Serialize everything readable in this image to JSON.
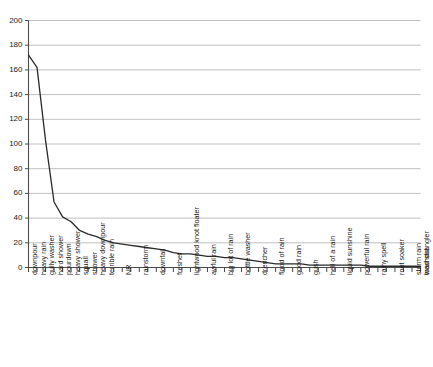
{
  "chart_data": {
    "type": "line",
    "title": "",
    "subtitle": "",
    "xlabel": "",
    "ylabel": "",
    "xlim": [
      0,
      47
    ],
    "ylim": [
      0,
      200
    ],
    "grid": true,
    "grid_axis": "y",
    "legend": "none",
    "line_color": "#2b2b2b",
    "grid_color": "#b0b0b0",
    "axis_color": "#4d4d4d",
    "yticks": [
      0,
      20,
      40,
      60,
      80,
      100,
      120,
      140,
      160,
      180,
      200
    ],
    "ytick_labels": [
      "0",
      "20",
      "40",
      "60",
      "80",
      "100",
      "120",
      "140",
      "160",
      "180",
      "200"
    ],
    "categories": [
      "downpour",
      "heavy rain",
      "gully washer",
      "hard shower",
      "pourdown",
      "heavy shower",
      "squall",
      "shower",
      "heavy downpour",
      "terrible rain",
      "NR",
      "rainstorm",
      "downfall",
      "freshet",
      "lightwood knot floater",
      "awful rain",
      "big lot of rain",
      "bottle washer",
      "drencher",
      "flood of rain",
      "good rain",
      "gush",
      "hell of a rain",
      "liquid sunshine",
      "powerful rain",
      "rainy spell",
      "root soaker",
      "storm rain",
      "toad strangler",
      "washout"
    ],
    "values": [
      172,
      162,
      103,
      53,
      41,
      37,
      30,
      27,
      25,
      22,
      20,
      19,
      18,
      17,
      16,
      15,
      14,
      12,
      11,
      11,
      10,
      9,
      9,
      8,
      8,
      7,
      6,
      5,
      4,
      3
    ],
    "series": [
      {
        "name": "frequency",
        "values": [
          172,
          162,
          103,
          53,
          41,
          37,
          30,
          27,
          25,
          22,
          20,
          19,
          18,
          17,
          16,
          15,
          14,
          12,
          11,
          11,
          10,
          9,
          9,
          8,
          8,
          7,
          6,
          5,
          4,
          3
        ]
      }
    ],
    "tail_values": [
      3,
      3,
      3,
      2,
      2,
      2,
      2,
      2,
      2,
      2,
      1,
      1,
      1,
      1,
      1,
      1,
      1
    ],
    "n_xticks": 47,
    "n_labeled_categories": 30,
    "annotations": []
  }
}
